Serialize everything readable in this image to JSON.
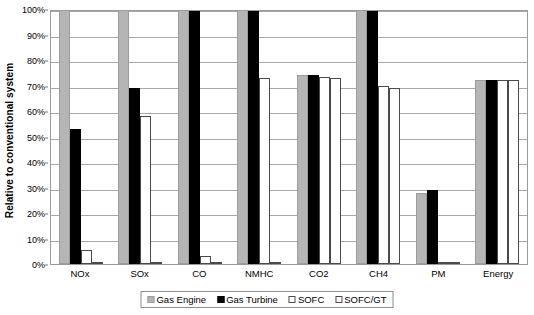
{
  "chart_data": {
    "type": "bar",
    "title": "",
    "subtitle": "",
    "xlabel": "",
    "ylabel": "Relative to conventional system",
    "ylim": [
      0,
      100
    ],
    "y_unit": "%",
    "grid": true,
    "grid_axis": "y",
    "legend_position": "bottom",
    "orientation": "vertical",
    "categories": [
      "NOx",
      "SOx",
      "CO",
      "NMHC",
      "CO2",
      "CH4",
      "PM",
      "Energy"
    ],
    "y_ticks": [
      "0%",
      "10%",
      "20%",
      "30%",
      "40%",
      "50%",
      "60%",
      "70%",
      "80%",
      "90%",
      "100%"
    ],
    "y_tick_values": [
      0,
      10,
      20,
      30,
      40,
      50,
      60,
      70,
      80,
      90,
      100
    ],
    "series": [
      {
        "name": "Gas Engine",
        "color": "#b5b5b5",
        "values": [
          100,
          100,
          100,
          100,
          74,
          100,
          28,
          72
        ]
      },
      {
        "name": "Gas Turbine",
        "color": "#000000",
        "values": [
          53,
          69,
          100,
          100,
          74,
          100,
          29,
          72
        ]
      },
      {
        "name": "SOFC",
        "color": "#ffffff",
        "values": [
          5.5,
          58,
          3,
          73,
          73.5,
          70,
          0.4,
          72
        ]
      },
      {
        "name": "SOFC/GT",
        "color": "#ffffff",
        "values": [
          0.5,
          0.5,
          0.5,
          0.5,
          73,
          69,
          0.4,
          72
        ]
      }
    ]
  },
  "axis": {
    "y_title": "Relative to conventional system"
  },
  "legend": {
    "items": [
      {
        "label": "Gas Engine"
      },
      {
        "label": "Gas Turbine"
      },
      {
        "label": "SOFC"
      },
      {
        "label": "SOFC/GT"
      }
    ]
  },
  "colors": {
    "gas_engine": "#b5b5b5",
    "gas_turbine": "#000000",
    "sofc": "#ffffff",
    "sofc_gt": "#ffffff",
    "gridline": "#a8a8a8",
    "plot_border": "#9a9a9a",
    "background": "#ffffff"
  }
}
